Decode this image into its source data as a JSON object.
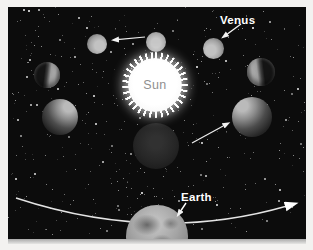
{
  "diagram": {
    "labels": {
      "sun": "Sun",
      "venus": "Venus",
      "earth": "Earth"
    },
    "bodies": [
      {
        "id": "venus-upper-left",
        "phase": "gibbous"
      },
      {
        "id": "venus-top-center",
        "phase": "full"
      },
      {
        "id": "venus-upper-right",
        "phase": "gibbous"
      },
      {
        "id": "venus-mid-left",
        "phase": "half"
      },
      {
        "id": "venus-mid-right",
        "phase": "half"
      },
      {
        "id": "venus-lower-left",
        "phase": "crescent"
      },
      {
        "id": "venus-lower-right",
        "phase": "crescent"
      },
      {
        "id": "venus-bottom-center",
        "phase": "new"
      },
      {
        "id": "sun",
        "phase": ""
      },
      {
        "id": "earth",
        "phase": ""
      }
    ],
    "arrows": [
      "venus-orbit-direction-top",
      "venus-label-pointer",
      "venus-orbit-direction-inner",
      "earth-label-pointer",
      "earth-orbit-direction"
    ],
    "colors": {
      "space_background": "#0c0c0c",
      "star": "#ffffff",
      "label_text": "#ffffff",
      "sun_label_text": "#8f8f8f",
      "arrow": "#efefef",
      "page_background": "#f3f2f0"
    }
  }
}
